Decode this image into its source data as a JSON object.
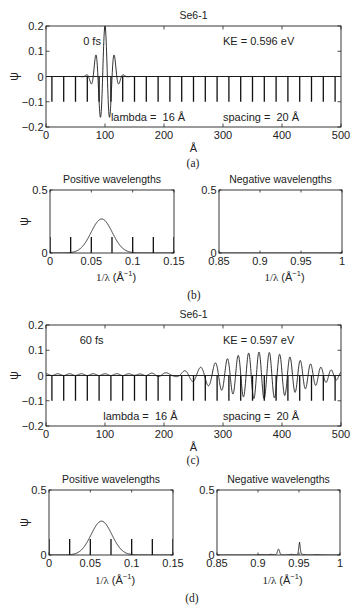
{
  "figure": {
    "captions": {
      "a": "(a)",
      "b": "(b)",
      "c": "(c)",
      "d": "(d)"
    },
    "line_color": "#1a1a1a",
    "background": "#ffffff"
  },
  "chart_data": [
    {
      "panel": "a",
      "type": "line",
      "title": "Se6-1",
      "xlabel": "Å",
      "ylabel": "ψ",
      "xlim": [
        0,
        500
      ],
      "ylim": [
        -0.2,
        0.2
      ],
      "grid": false,
      "xticks": [
        0,
        100,
        200,
        300,
        400,
        500
      ],
      "xtick_labels": [
        "0",
        "100",
        "200",
        "300",
        "400",
        "500"
      ],
      "yticks": [
        -0.2,
        -0.1,
        0,
        0.1,
        0.2
      ],
      "ytick_labels": [
        "−0.2",
        "−0.1",
        "0",
        "0.1",
        "0.2"
      ],
      "annotations": [
        {
          "text": "0 fs",
          "x": 63,
          "y": 0.125
        },
        {
          "text": "KE = 0.596 eV",
          "x": 300,
          "y": 0.125
        },
        {
          "text": "lambda =  16 Å",
          "x": 110,
          "y": -0.175
        },
        {
          "text": "spacing =  20 Å",
          "x": 300,
          "y": -0.175
        }
      ],
      "series": [
        {
          "name": "zero-line",
          "kind": "hline",
          "y": 0
        },
        {
          "name": "potential-wells",
          "kind": "spikes",
          "x": [
            10,
            30,
            50,
            70,
            90,
            110,
            130,
            150,
            170,
            190,
            210,
            230,
            250,
            270,
            290,
            310,
            330,
            350,
            370,
            390,
            410,
            430,
            450,
            470,
            490
          ],
          "y_from": 0,
          "y_to": -0.1
        },
        {
          "name": "wavefunction",
          "kind": "wavepacket",
          "center": 100,
          "sigma": 12,
          "wavelength": 16,
          "amplitude": 0.2
        }
      ]
    },
    {
      "panel": "b-left",
      "type": "line",
      "title": "Positive wavelengths",
      "xlabel": {
        "var": "1/λ",
        "unit_open": " (Å",
        "unit_sup": "−1",
        "unit_close": ")"
      },
      "ylabel": "ψ",
      "xlim": [
        0,
        0.15
      ],
      "ylim": [
        0,
        0.5
      ],
      "grid": false,
      "xticks": [
        0,
        0.05,
        0.1,
        0.15
      ],
      "xtick_labels": [
        "0",
        "0.05",
        "0.1",
        "0.15"
      ],
      "yticks": [
        0,
        0.5
      ],
      "ytick_labels": [
        "0",
        "0.5"
      ],
      "annotations": [],
      "series": [
        {
          "name": "lattice-peaks",
          "kind": "spikes",
          "x": [
            0,
            0.025,
            0.05,
            0.075,
            0.1,
            0.125,
            0.15
          ],
          "y_from": 0,
          "y_to": 0.127
        },
        {
          "name": "spectrum",
          "kind": "gaussians",
          "components": [
            {
              "center": 0.0625,
              "sigma": 0.0128,
              "amplitude": 0.27
            }
          ],
          "tails": []
        }
      ]
    },
    {
      "panel": "b-right",
      "type": "line",
      "title": "Negative wavelengths",
      "xlabel": {
        "var": "1/λ",
        "unit_open": " (Å",
        "unit_sup": "−1",
        "unit_close": ")"
      },
      "ylabel": "",
      "xlim": [
        0.85,
        1
      ],
      "ylim": [
        0,
        0.5
      ],
      "grid": false,
      "xticks": [
        0.85,
        0.9,
        0.95,
        1
      ],
      "xtick_labels": [
        "0.85",
        "0.9",
        "0.95",
        "1"
      ],
      "yticks": [
        0,
        0.5
      ],
      "ytick_labels": [
        "0",
        "0.5"
      ],
      "annotations": [],
      "series": [
        {
          "name": "spectrum",
          "kind": "gaussians",
          "components": [],
          "tails": []
        }
      ]
    },
    {
      "panel": "c",
      "type": "line",
      "title": "Se6-1",
      "xlabel": "Å",
      "ylabel": "ψ",
      "xlim": [
        0,
        500
      ],
      "ylim": [
        -0.2,
        0.2
      ],
      "grid": false,
      "xticks": [
        0,
        100,
        200,
        300,
        400,
        500
      ],
      "xtick_labels": [
        "0",
        "100",
        "200",
        "300",
        "400",
        "500"
      ],
      "yticks": [
        -0.2,
        -0.1,
        0,
        0.1,
        0.2
      ],
      "ytick_labels": [
        "−0.2",
        "−0.1",
        "0",
        "0.1",
        "0.2"
      ],
      "annotations": [
        {
          "text": "60 fs",
          "x": 57,
          "y": 0.125
        },
        {
          "text": "KE = 0.597 eV",
          "x": 300,
          "y": 0.125
        },
        {
          "text": "lambda =  16 Å",
          "x": 97,
          "y": -0.175
        },
        {
          "text": "spacing =  20 Å",
          "x": 300,
          "y": -0.175
        }
      ],
      "series": [
        {
          "name": "zero-line",
          "kind": "hline",
          "y": 0
        },
        {
          "name": "potential-wells",
          "kind": "spikes",
          "x": [
            10,
            30,
            50,
            70,
            90,
            110,
            130,
            150,
            170,
            190,
            210,
            230,
            250,
            270,
            290,
            310,
            330,
            350,
            370,
            390,
            410,
            430,
            450,
            470,
            490
          ],
          "y_from": 0,
          "y_to": -0.1
        },
        {
          "name": "wavefunction",
          "kind": "chirped_wavepacket",
          "center": 365,
          "sigma": 70,
          "amplitude": 0.093,
          "wavelength": 17.5,
          "wavelength_trailing": 28.5,
          "chirp_center": 285,
          "chirp_width": 12,
          "phase_ref": 361,
          "ripple": {
            "amplitude": 0.007,
            "period": 20,
            "offset": 20,
            "until": 245
          }
        }
      ]
    },
    {
      "panel": "d-left",
      "type": "line",
      "title": "Positive wavelengths",
      "xlabel": {
        "var": "1/λ",
        "unit_open": " (Å",
        "unit_sup": "−1",
        "unit_close": ")"
      },
      "ylabel": "ψ",
      "xlim": [
        0,
        0.15
      ],
      "ylim": [
        0,
        0.5
      ],
      "grid": false,
      "xticks": [
        0,
        0.05,
        0.1,
        0.15
      ],
      "xtick_labels": [
        "0",
        "0.05",
        "0.1",
        "0.15"
      ],
      "yticks": [
        0,
        0.5
      ],
      "ytick_labels": [
        "0",
        "0.5"
      ],
      "annotations": [],
      "series": [
        {
          "name": "lattice-peaks",
          "kind": "spikes",
          "x": [
            0,
            0.025,
            0.05,
            0.075,
            0.1,
            0.125,
            0.15
          ],
          "y_from": 0,
          "y_to": 0.123
        },
        {
          "name": "spectrum",
          "kind": "gaussians",
          "components": [
            {
              "center": 0.0635,
              "sigma": 0.0125,
              "amplitude": 0.26
            }
          ],
          "tails": []
        }
      ]
    },
    {
      "panel": "d-right",
      "type": "line",
      "title": "Negative wavelengths",
      "xlabel": {
        "var": "1/λ",
        "unit_open": " (Å",
        "unit_sup": "−1",
        "unit_close": ")"
      },
      "ylabel": "",
      "xlim": [
        0.85,
        1
      ],
      "ylim": [
        0,
        0.5
      ],
      "grid": false,
      "xticks": [
        0.85,
        0.9,
        0.95,
        1
      ],
      "xtick_labels": [
        "0.85",
        "0.9",
        "0.95",
        "1"
      ],
      "yticks": [
        0,
        0.5
      ],
      "ytick_labels": [
        "0",
        "0.5"
      ],
      "annotations": [],
      "series": [
        {
          "name": "spectrum",
          "kind": "gaussians",
          "components": [
            {
              "center": 0.905,
              "sigma": 0.003,
              "amplitude": 0.004
            },
            {
              "center": 0.916,
              "sigma": 0.003,
              "amplitude": 0.005
            },
            {
              "center": 0.925,
              "sigma": 0.0013,
              "amplitude": 0.045
            },
            {
              "center": 0.941,
              "sigma": 0.003,
              "amplitude": 0.005
            },
            {
              "center": 0.9505,
              "sigma": 0.0009,
              "amplitude": 0.085
            },
            {
              "center": 0.972,
              "sigma": 0.004,
              "amplitude": 0.003
            }
          ],
          "tails": [
            {
              "start": 0.9505,
              "decay": 0.004,
              "amplitude": 0.014
            }
          ]
        }
      ]
    }
  ]
}
